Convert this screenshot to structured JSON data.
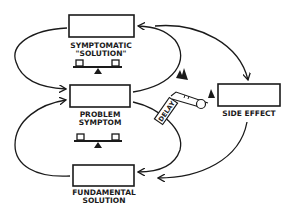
{
  "diagram": {
    "type": "causal-loop-archetype",
    "colors": {
      "ink": "#1a1a1a",
      "background": "#ffffff"
    },
    "nodes": [
      {
        "id": "symptomatic",
        "label_line1": "SYMPTOMATIC",
        "label_line2": "\"SOLUTION\""
      },
      {
        "id": "problem",
        "label_line1": "PROBLEM",
        "label_line2": "SYMPTOM"
      },
      {
        "id": "fundamental",
        "label_line1": "FUNDAMENTAL",
        "label_line2": "SOLUTION"
      },
      {
        "id": "side_effect",
        "label_line1": "SIDE EFFECT"
      }
    ],
    "delay_label": "DELAY",
    "icons": {
      "balance_1": "seesaw-balance-icon",
      "balance_2": "seesaw-balance-icon",
      "snowball": "snowball-reinforcing-icon"
    }
  }
}
